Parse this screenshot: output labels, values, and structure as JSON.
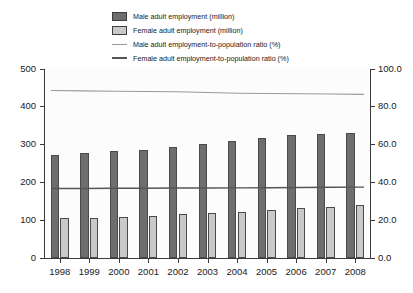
{
  "chart_data": {
    "type": "bar",
    "title": "",
    "subtitle": "",
    "xlabel": "",
    "ylabel": "",
    "y2label": "",
    "grid": false,
    "legend_position": "top-center",
    "categories": [
      "1998",
      "1999",
      "2000",
      "2001",
      "2002",
      "2003",
      "2004",
      "2005",
      "2006",
      "2007",
      "2008"
    ],
    "ylim": [
      0,
      500
    ],
    "yticks": [
      "0",
      "100",
      "200",
      "300",
      "400",
      "500"
    ],
    "ylim_secondary": [
      0,
      100
    ],
    "yticks_secondary": [
      "0.0",
      "20.0",
      "40.0",
      "60.0",
      "80.0",
      "100.0"
    ],
    "series": [
      {
        "name": "Male adult employment (million)",
        "chart_type": "bar",
        "axis": "left",
        "color": "#6e6e6e",
        "values": [
          272,
          277,
          282,
          287,
          294,
          301,
          310,
          318,
          325,
          328,
          332
        ]
      },
      {
        "name": "Female adult employment (million)",
        "chart_type": "bar",
        "axis": "left",
        "color": "#c9c9c9",
        "values": [
          106,
          107,
          109,
          112,
          116,
          118,
          121,
          126,
          131,
          136,
          140
        ]
      },
      {
        "name": "Male adult employment-to-population ratio (%)",
        "chart_type": "line",
        "axis": "right",
        "color": "#9a9a9a",
        "values": [
          88.6,
          88.4,
          88.2,
          88.1,
          88.0,
          87.6,
          87.2,
          87.0,
          86.9,
          86.8,
          86.6
        ]
      },
      {
        "name": "Female adult employment-to-population ratio (%)",
        "chart_type": "line",
        "axis": "right",
        "color": "#555555",
        "values": [
          36.8,
          36.8,
          36.9,
          36.9,
          37.0,
          37.0,
          37.1,
          37.2,
          37.3,
          37.4,
          37.5
        ]
      }
    ]
  },
  "legend": {
    "items": [
      {
        "label": "Male adult employment (million)",
        "key": "swatch-dark",
        "color": "#6e6e6e"
      },
      {
        "label": "Female adult employment (million)",
        "key": "swatch-light",
        "color": "#c9c9c9"
      },
      {
        "label": "Male adult employment-to-population ratio (%)",
        "key": "line-light",
        "color": "#9a9a9a"
      },
      {
        "label": "Female adult employment-to-population ratio (%)",
        "key": "line-dark",
        "color": "#555555"
      }
    ]
  }
}
